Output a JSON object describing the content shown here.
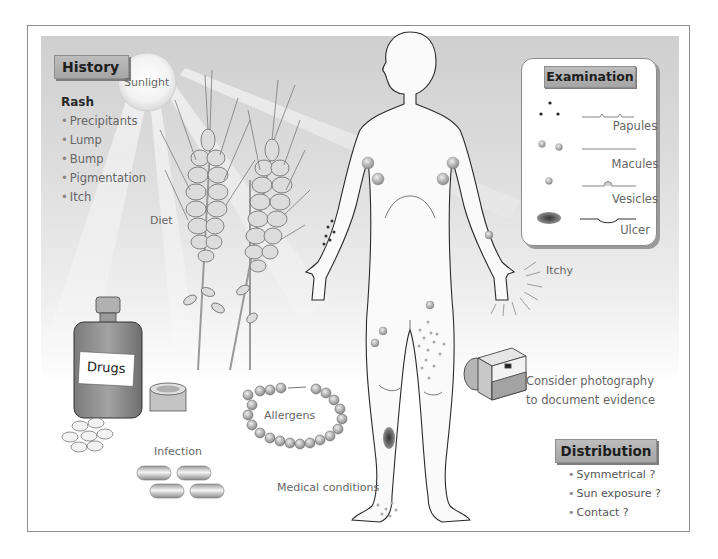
{
  "diagram": {
    "topic": "Rash assessment",
    "history": {
      "title": "History",
      "heading": "Rash",
      "items": [
        "Precipitants",
        "Lump",
        "Bump",
        "Pigmentation",
        "Itch"
      ]
    },
    "factors": {
      "sunlight": "Sunlight",
      "diet": "Diet",
      "drugs": "Drugs",
      "allergens": "Allergens",
      "infection": "Infection",
      "medical_conditions": "Medical conditions",
      "itchy": "Itchy"
    },
    "examination": {
      "title": "Examination",
      "lesions": [
        {
          "label": "Papules"
        },
        {
          "label": "Macules"
        },
        {
          "label": "Vesicles"
        },
        {
          "label": "Ulcer"
        }
      ]
    },
    "photography": {
      "line1": "Consider photography",
      "line2": "to document evidence"
    },
    "distribution": {
      "title": "Distribution",
      "items": [
        "Symmetrical ?",
        "Sun exposure ?",
        "Contact ?"
      ]
    },
    "colors": {
      "panel_top": "#cfcfcf",
      "tag_fill": "#b3b3b3",
      "outline": "#333333",
      "lesion": "#8f8f8f"
    }
  }
}
